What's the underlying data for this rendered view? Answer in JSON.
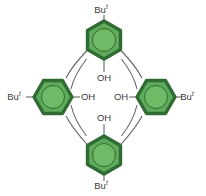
{
  "figure": {
    "name": "calix-4-arene-structure",
    "background_color": "#ffffff",
    "colors": {
      "ring_fill": "#5fab5c",
      "ring_border": "#2f6b33",
      "ring_inner_circle": "#6fba66",
      "bond": "#666666",
      "text": "#3a3a3a"
    },
    "bond_width": 1.1,
    "ring_radius": 19,
    "ring_border_width": 3.4
  },
  "rings": [
    {
      "id": "ring-top",
      "cx": 104,
      "cy": 40,
      "substituent": "Bu",
      "substituent_sup": "t",
      "hydroxyl": "OH"
    },
    {
      "id": "ring-left",
      "cx": 53,
      "cy": 97,
      "substituent": "Bu",
      "substituent_sup": "t",
      "hydroxyl": "OH"
    },
    {
      "id": "ring-right",
      "cx": 156,
      "cy": 97,
      "substituent": "Bu",
      "substituent_sup": "t",
      "hydroxyl": "OH"
    },
    {
      "id": "ring-bottom",
      "cx": 104,
      "cy": 155,
      "substituent": "Bu",
      "substituent_sup": "t",
      "hydroxyl": "OH"
    }
  ],
  "labels": {
    "tbutyl_top": {
      "text": "Bu",
      "sup": "t",
      "x": 104,
      "y": 10
    },
    "tbutyl_left": {
      "text": "Bu",
      "sup": "t",
      "x": 17,
      "y": 97
    },
    "tbutyl_right": {
      "text": "Bu",
      "sup": "t",
      "x": 190,
      "y": 97
    },
    "tbutyl_bottom": {
      "text": "Bu",
      "sup": "t",
      "x": 104,
      "y": 186
    },
    "oh_top": {
      "text": "OH",
      "x": 104,
      "y": 78
    },
    "oh_left": {
      "text": "OH",
      "x": 87,
      "y": 97
    },
    "oh_right": {
      "text": "OH",
      "x": 122,
      "y": 97
    },
    "oh_bottom": {
      "text": "OH",
      "x": 104,
      "y": 118
    }
  }
}
